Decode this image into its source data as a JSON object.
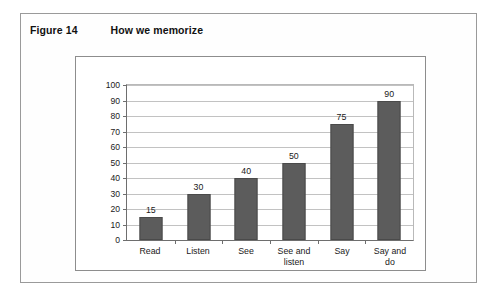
{
  "figure": {
    "number_label": "Figure 14",
    "title": "How we memorize"
  },
  "colors": {
    "bar_fill": "#5c5c5c",
    "bar_stroke": "#4a4a4a",
    "gridline": "#c2c2c2",
    "axis": "#6e6e6e",
    "frame": "#9a9a9a",
    "chart_frame": "#8d8d8d",
    "background": "#ffffff",
    "text": "#1a1a1a"
  },
  "chart_data": {
    "type": "bar",
    "title": "How we memorize",
    "xlabel": "",
    "ylabel": "",
    "categories": [
      "Read",
      "Listen",
      "See",
      "See and listen",
      "Say",
      "Say and do"
    ],
    "values": [
      15,
      30,
      40,
      50,
      75,
      90
    ],
    "value_labels": [
      "15",
      "30",
      "40",
      "50",
      "75",
      "90"
    ],
    "ylim": [
      0,
      100
    ],
    "ytick_step": 10,
    "yticks": [
      0,
      10,
      20,
      30,
      40,
      50,
      60,
      70,
      80,
      90,
      100
    ],
    "ytick_labels": [
      "0",
      "10",
      "20",
      "30",
      "40",
      "50",
      "60",
      "70",
      "80",
      "90",
      "100"
    ],
    "grid": true,
    "grid_axis": "y",
    "legend": false,
    "legend_position": "none",
    "series": [
      {
        "name": "Retention",
        "values": [
          15,
          30,
          40,
          50,
          75,
          90
        ]
      }
    ],
    "category_label_lines": [
      [
        "Read"
      ],
      [
        "Listen"
      ],
      [
        "See"
      ],
      [
        "See and",
        "listen"
      ],
      [
        "Say"
      ],
      [
        "Say and",
        "do"
      ]
    ]
  }
}
